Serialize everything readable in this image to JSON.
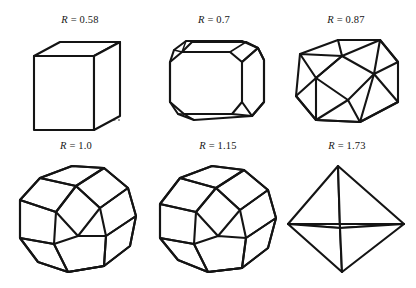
{
  "figure": {
    "background_color": "#ffffff",
    "line_color": "#141414",
    "hidden_line_color": "#3a3a3a",
    "symbol": "R",
    "separator": "=",
    "rows": 2,
    "columns": 3
  },
  "panels": [
    {
      "id": "panel-r-058",
      "label": "R = 0.58",
      "symbol": "R",
      "value": "0.58",
      "shape_name": "cube"
    },
    {
      "id": "panel-r-07",
      "label": "R = 0.7",
      "symbol": "R",
      "value": "0.7",
      "shape_name": "truncated-cube"
    },
    {
      "id": "panel-r-087",
      "label": "R = 0.87",
      "symbol": "R",
      "value": "0.87",
      "shape_name": "cuboctahedron"
    },
    {
      "id": "panel-r-10",
      "label": "R = 1.0",
      "symbol": "R",
      "value": "1.0",
      "shape_name": "rhombicuboctahedron"
    },
    {
      "id": "panel-r-115",
      "label": "R = 1.15",
      "symbol": "R",
      "value": "1.15",
      "shape_name": "truncated-octahedron"
    },
    {
      "id": "panel-r-173",
      "label": "R = 1.73",
      "symbol": "R",
      "value": "1.73",
      "shape_name": "octahedron"
    }
  ]
}
